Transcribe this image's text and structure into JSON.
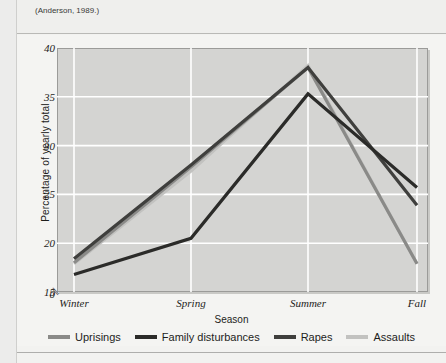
{
  "caption": {
    "source_note": "(Anderson, 1989.)"
  },
  "margin_note": "Figure reproduced from source text",
  "chart_data": {
    "type": "line",
    "title": "",
    "xlabel": "Season",
    "ylabel": "Percentage of yearly total",
    "categories": [
      "Winter",
      "Spring",
      "Summer",
      "Fall"
    ],
    "ylim": [
      15,
      40
    ],
    "yticks": [
      "0",
      "15",
      "20",
      "25",
      "30",
      "35",
      "40"
    ],
    "y_axis_break": true,
    "grid": true,
    "legend_position": "bottom",
    "series": [
      {
        "name": "Uprisings",
        "color": "#8a8a88",
        "values": [
          18.0,
          27.8,
          38.0,
          17.9
        ]
      },
      {
        "name": "Family disturbances",
        "color": "#2b2b29",
        "values": [
          16.8,
          20.5,
          35.3,
          25.7
        ]
      },
      {
        "name": "Rapes",
        "color": "#3f3f3d",
        "values": [
          18.4,
          28.0,
          38.0,
          23.9
        ]
      },
      {
        "name": "Assaults",
        "color": "#c2c2c0",
        "values": [
          17.9,
          27.4,
          38.2,
          17.9
        ]
      }
    ]
  },
  "legend": {
    "items": [
      {
        "label": "Uprisings",
        "color": "#8a8a88"
      },
      {
        "label": "Family disturbances",
        "color": "#2b2b29"
      },
      {
        "label": "Rapes",
        "color": "#3f3f3d"
      },
      {
        "label": "Assaults",
        "color": "#c2c2c0"
      }
    ]
  }
}
